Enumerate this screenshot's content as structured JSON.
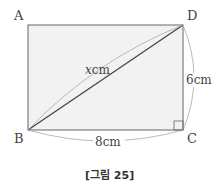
{
  "figure": {
    "vertices": {
      "A": "A",
      "B": "B",
      "C": "C",
      "D": "D"
    },
    "dimensions": {
      "diagonal_var": "x",
      "diagonal_unit": "cm",
      "height": "6cm",
      "width": "8cm"
    },
    "caption": "[그림 25]",
    "colors": {
      "fill": "#f2f2f2",
      "stroke": "#555555",
      "arc": "#999999"
    }
  }
}
